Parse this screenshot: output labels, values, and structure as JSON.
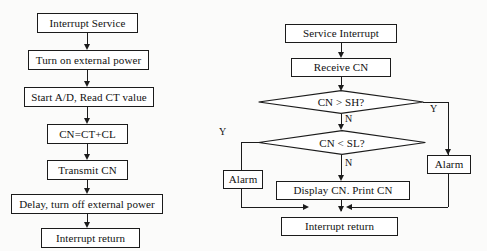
{
  "figure": {
    "kind": "flowchart-pair",
    "background_color": "#fbfbfa",
    "line_color": "#1b1b1b",
    "text_color": "#111111"
  },
  "left_flowchart": {
    "name": "interrupt-service-routine",
    "nodes": [
      {
        "id": "l1",
        "shape": "process",
        "text": "Interrupt Service"
      },
      {
        "id": "l2",
        "shape": "process",
        "text": "Turn on external power"
      },
      {
        "id": "l3",
        "shape": "process",
        "text": "Start A/D, Read CT value"
      },
      {
        "id": "l4",
        "shape": "process",
        "text": "CN=CT+CL"
      },
      {
        "id": "l5",
        "shape": "process",
        "text": "Transmit CN"
      },
      {
        "id": "l6",
        "shape": "process",
        "text": "Delay, turn off external power"
      },
      {
        "id": "l7",
        "shape": "process",
        "text": "Interrupt return"
      }
    ]
  },
  "right_flowchart": {
    "name": "service-interrupt-routine",
    "nodes": [
      {
        "id": "r1",
        "shape": "process",
        "text": "Service Interrupt"
      },
      {
        "id": "r2",
        "shape": "process",
        "text": "Receive CN"
      },
      {
        "id": "r3",
        "shape": "decision",
        "text": "CN > SH?"
      },
      {
        "id": "r4",
        "shape": "decision",
        "text": "CN < SL?"
      },
      {
        "id": "r5",
        "shape": "process",
        "text": "Alarm"
      },
      {
        "id": "r6",
        "shape": "process",
        "text": "Alarm"
      },
      {
        "id": "r7",
        "shape": "process",
        "text": "Display CN. Print CN"
      },
      {
        "id": "r8",
        "shape": "process",
        "text": "Interrupt return"
      }
    ],
    "branch_labels": {
      "sh_yes": "Y",
      "sh_no": "N",
      "sl_yes": "Y",
      "sl_no": "N"
    }
  }
}
